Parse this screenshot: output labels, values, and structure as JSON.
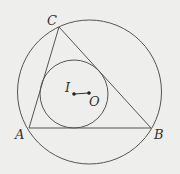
{
  "diagram": {
    "colors": {
      "background": "#eeeeec",
      "stroke": "#555555",
      "text": "#333333"
    },
    "points": {
      "A": {
        "label": "A",
        "x": 29,
        "y": 128
      },
      "B": {
        "label": "B",
        "x": 151,
        "y": 128
      },
      "C": {
        "label": "C",
        "x": 59,
        "y": 27
      },
      "I": {
        "label": "I",
        "x": 74,
        "y": 94
      },
      "O": {
        "label": "O",
        "x": 89,
        "y": 93
      }
    },
    "circles": {
      "circumcircle": {
        "cx": 89.5,
        "cy": 92,
        "r": 72
      },
      "incircle": {
        "cx": 74,
        "cy": 94,
        "r": 34
      }
    },
    "segments": [
      "AB",
      "BC",
      "CA",
      "IO"
    ]
  }
}
